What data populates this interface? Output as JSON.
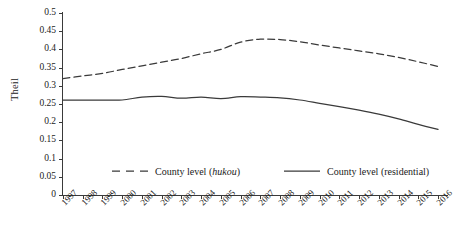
{
  "chart_data": {
    "type": "line",
    "title": "",
    "xlabel": "",
    "ylabel": "Theil",
    "ylim": [
      0,
      0.5
    ],
    "ytick_step": 0.05,
    "grid": false,
    "legend_position": "inside-bottom",
    "x": [
      "1997",
      "1998",
      "1999",
      "2000",
      "2001",
      "2002",
      "2003",
      "2004",
      "2005",
      "2006",
      "2007",
      "2008",
      "2009",
      "2010",
      "2011",
      "2012",
      "2013",
      "2014",
      "2015",
      "2016"
    ],
    "ytick_labels": [
      "0",
      "0.05",
      "0.1",
      "0.15",
      "0.2",
      "0.25",
      "0.3",
      "0.35",
      "0.4",
      "0.45",
      "0.5"
    ],
    "ytick_values": [
      0,
      0.05,
      0.1,
      0.15,
      0.2,
      0.25,
      0.3,
      0.35,
      0.4,
      0.45,
      0.5
    ],
    "series": [
      {
        "name": "County level (hukou)",
        "name_plain": "County level (",
        "name_italic": "hukou",
        "name_tail": ")",
        "style": "dashed",
        "color": "#3a3a3a",
        "values": [
          0.32,
          0.327,
          0.334,
          0.345,
          0.355,
          0.365,
          0.375,
          0.388,
          0.4,
          0.42,
          0.428,
          0.427,
          0.421,
          0.412,
          0.404,
          0.396,
          0.388,
          0.378,
          0.366,
          0.353
        ]
      },
      {
        "name": "County level (residential)",
        "name_plain": "County level (residential)",
        "style": "solid",
        "color": "#3a3a3a",
        "values": [
          0.261,
          0.261,
          0.261,
          0.261,
          0.269,
          0.271,
          0.266,
          0.269,
          0.265,
          0.27,
          0.269,
          0.267,
          0.261,
          0.252,
          0.243,
          0.233,
          0.222,
          0.209,
          0.194,
          0.18
        ]
      }
    ]
  },
  "legend": {
    "items": [
      {
        "label_plain": "County level (",
        "label_italic": "hukou",
        "label_tail": ")",
        "style": "dashed"
      },
      {
        "label_plain": "County level (residential)",
        "label_italic": "",
        "label_tail": "",
        "style": "solid"
      }
    ]
  }
}
